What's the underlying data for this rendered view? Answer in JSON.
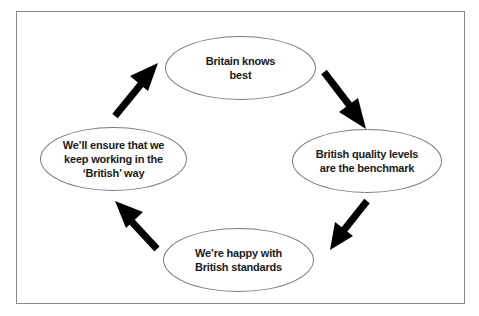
{
  "diagram": {
    "type": "cycle",
    "nodes": [
      {
        "id": "top",
        "label": "Britain knows\nbest"
      },
      {
        "id": "right",
        "label": "British quality levels\nare the benchmark"
      },
      {
        "id": "bottom",
        "label": "We’re happy with\nBritish standards"
      },
      {
        "id": "left",
        "label": "We’ll ensure that we\nkeep working in the\n‘British’ way"
      }
    ],
    "edges": [
      {
        "from": "top",
        "to": "right"
      },
      {
        "from": "right",
        "to": "bottom"
      },
      {
        "from": "bottom",
        "to": "left"
      },
      {
        "from": "left",
        "to": "top"
      }
    ],
    "colors": {
      "arrow": "#000000",
      "ellipse_stroke": "#7a7a7a",
      "frame": "#8a8a8a"
    }
  }
}
